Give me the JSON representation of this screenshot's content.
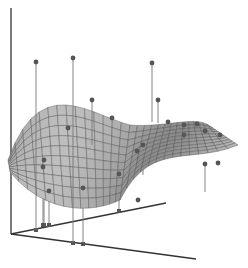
{
  "chart_data": {
    "type": "surface3d",
    "title": "",
    "xlabel": "",
    "ylabel": "",
    "zlabel": "",
    "grid": false,
    "legend": null,
    "surface": {
      "description": "Smooth saddle-like surface with a high ridge at back-left, a dip in the middle, and a second raised lobe at right",
      "fill": "#a9a9a9",
      "mesh_color": "#4a4a4a",
      "grid_lines_u": 16,
      "grid_lines_v": 10
    },
    "scatter_points": [
      {
        "x": 36,
        "y": 62,
        "base_y": 230,
        "above": true
      },
      {
        "x": 73,
        "y": 58,
        "base_y": 243,
        "above": true
      },
      {
        "x": 92,
        "y": 100,
        "base_y": 145,
        "above": true
      },
      {
        "x": 112,
        "y": 118,
        "base_y": 140,
        "above": false
      },
      {
        "x": 68,
        "y": 128,
        "base_y": 160,
        "above": false
      },
      {
        "x": 152,
        "y": 63,
        "base_y": 122,
        "above": true
      },
      {
        "x": 158,
        "y": 100,
        "base_y": 123,
        "above": true
      },
      {
        "x": 168,
        "y": 122,
        "base_y": 135,
        "above": false
      },
      {
        "x": 197,
        "y": 124,
        "base_y": 145,
        "above": false
      },
      {
        "x": 184,
        "y": 125,
        "base_y": 145,
        "above": false
      },
      {
        "x": 184,
        "y": 135,
        "base_y": 150,
        "above": false
      },
      {
        "x": 205,
        "y": 131,
        "base_y": 150,
        "above": false
      },
      {
        "x": 220,
        "y": 135,
        "base_y": 145,
        "above": false
      },
      {
        "x": 44,
        "y": 160,
        "base_y": 225,
        "above": false
      },
      {
        "x": 43,
        "y": 167,
        "base_y": 225,
        "above": false
      },
      {
        "x": 49,
        "y": 191,
        "base_y": 225,
        "above": false
      },
      {
        "x": 83,
        "y": 188,
        "base_y": 244,
        "above": false
      },
      {
        "x": 119,
        "y": 174,
        "base_y": 211,
        "above": false
      },
      {
        "x": 143,
        "y": 145,
        "base_y": 175,
        "above": false
      },
      {
        "x": 137,
        "y": 151,
        "base_y": 175,
        "above": false
      },
      {
        "x": 218,
        "y": 163,
        "base_y": 163,
        "above": false
      },
      {
        "x": 205,
        "y": 164,
        "base_y": 192,
        "above": false
      },
      {
        "x": 138,
        "y": 200,
        "base_y": 200,
        "above": false
      }
    ],
    "axes": {
      "z_axis": {
        "x1": 11,
        "y1": 8,
        "x2": 11,
        "y2": 234
      },
      "x_axis": {
        "x1": 11,
        "y1": 234,
        "x2": 166,
        "y2": 203
      },
      "y_axis": {
        "x1": 11,
        "y1": 234,
        "x2": 196,
        "y2": 259
      }
    },
    "colors": {
      "axis": "#333333",
      "marker": "#555555",
      "stem": "#777777"
    }
  }
}
